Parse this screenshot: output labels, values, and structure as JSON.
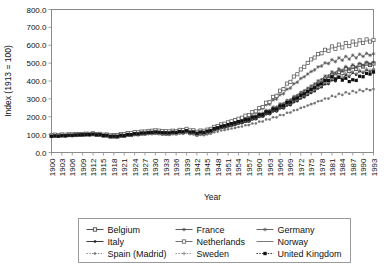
{
  "chart_data": {
    "type": "line",
    "title": "",
    "xlabel": "Year",
    "ylabel": "Index (1913 = 100)",
    "xlim": [
      1900,
      1993
    ],
    "ylim": [
      0,
      800
    ],
    "ytick_step": 100,
    "xtick_step": 3,
    "grid": false,
    "legend_position": "below",
    "ytick_labels": [
      "0.0",
      "100.0",
      "200.0",
      "300.0",
      "400.0",
      "500.0",
      "600.0",
      "700.0",
      "800.0"
    ],
    "xtick_labels": [
      "1900",
      "1903",
      "1906",
      "1909",
      "1912",
      "1915",
      "1918",
      "1921",
      "1924",
      "1927",
      "1930",
      "1933",
      "1936",
      "1939",
      "1942",
      "1945",
      "1948",
      "1951",
      "1954",
      "1957",
      "1960",
      "1963",
      "1966",
      "1969",
      "1972",
      "1975",
      "1978",
      "1981",
      "1984",
      "1987",
      "1990",
      "1993"
    ],
    "x": [
      1900,
      1903,
      1906,
      1909,
      1912,
      1915,
      1918,
      1921,
      1924,
      1927,
      1930,
      1933,
      1936,
      1939,
      1942,
      1945,
      1948,
      1951,
      1954,
      1957,
      1960,
      1963,
      1966,
      1969,
      1972,
      1975,
      1978,
      1981,
      1984,
      1987,
      1990,
      1993
    ],
    "series": [
      {
        "name": "Belgium",
        "marker": "square-open",
        "dash": "solid",
        "color": "#3a3a3a",
        "values": [
          92,
          95,
          98,
          100,
          103,
          96,
          88,
          95,
          102,
          108,
          112,
          106,
          110,
          118,
          104,
          112,
          138,
          152,
          168,
          182,
          205,
          228,
          252,
          282,
          318,
          352,
          392,
          428,
          452,
          470,
          488,
          498
        ]
      },
      {
        "name": "France",
        "marker": "star",
        "dash": "solid",
        "color": "#4a4a4a",
        "values": [
          95,
          97,
          99,
          101,
          104,
          98,
          92,
          100,
          106,
          112,
          118,
          112,
          115,
          122,
          110,
          118,
          142,
          158,
          175,
          192,
          215,
          240,
          268,
          298,
          335,
          372,
          412,
          445,
          468,
          482,
          495,
          505
        ]
      },
      {
        "name": "Germany",
        "marker": "star",
        "dash": "solid",
        "color": "#555555",
        "values": [
          96,
          99,
          101,
          103,
          105,
          100,
          94,
          102,
          110,
          116,
          122,
          116,
          120,
          128,
          115,
          122,
          145,
          162,
          182,
          205,
          238,
          275,
          318,
          365,
          412,
          452,
          488,
          512,
          525,
          535,
          545,
          552
        ]
      },
      {
        "name": "Italy",
        "marker": "dot",
        "dash": "solid",
        "color": "#222222",
        "values": [
          90,
          93,
          96,
          99,
          102,
          95,
          86,
          92,
          100,
          106,
          110,
          104,
          108,
          115,
          100,
          108,
          130,
          145,
          160,
          175,
          196,
          218,
          242,
          268,
          300,
          332,
          368,
          398,
          420,
          438,
          452,
          462
        ]
      },
      {
        "name": "Netherlands",
        "marker": "square-open",
        "dash": "solid",
        "color": "#606060",
        "values": [
          98,
          100,
          102,
          104,
          106,
          101,
          96,
          104,
          112,
          118,
          124,
          118,
          122,
          130,
          118,
          126,
          150,
          168,
          188,
          212,
          245,
          288,
          340,
          400,
          462,
          520,
          560,
          585,
          598,
          610,
          622,
          630
        ]
      },
      {
        "name": "Norway",
        "marker": "none",
        "dash": "solid",
        "color": "#6a6a6a",
        "values": [
          94,
          96,
          98,
          100,
          102,
          97,
          90,
          98,
          105,
          110,
          115,
          109,
          113,
          120,
          108,
          115,
          138,
          155,
          172,
          190,
          212,
          238,
          265,
          295,
          330,
          365,
          402,
          432,
          455,
          470,
          482,
          492
        ]
      },
      {
        "name": "Spain (Madrid)",
        "marker": "dot",
        "dash": "dotted",
        "color": "#777777",
        "values": [
          88,
          90,
          92,
          94,
          96,
          92,
          85,
          90,
          96,
          100,
          104,
          98,
          102,
          108,
          95,
          100,
          118,
          130,
          142,
          155,
          170,
          188,
          206,
          226,
          248,
          270,
          292,
          312,
          328,
          338,
          348,
          355
        ]
      },
      {
        "name": "Sweden",
        "marker": "plus",
        "dash": "dotted",
        "color": "#808080",
        "values": [
          93,
          95,
          97,
          99,
          101,
          96,
          89,
          96,
          103,
          108,
          113,
          107,
          111,
          118,
          106,
          113,
          135,
          150,
          166,
          182,
          202,
          225,
          250,
          278,
          310,
          342,
          378,
          408,
          430,
          445,
          458,
          468
        ]
      },
      {
        "name": "United Kingdom",
        "marker": "square-filled",
        "dash": "dotted",
        "color": "#111111",
        "values": [
          91,
          94,
          97,
          100,
          102,
          97,
          90,
          97,
          104,
          110,
          115,
          110,
          114,
          120,
          110,
          118,
          140,
          156,
          172,
          188,
          208,
          230,
          256,
          285,
          318,
          352,
          388,
          418,
          412,
          400,
          430,
          450
        ]
      }
    ]
  },
  "legend": {
    "entries": [
      {
        "label": "Belgium"
      },
      {
        "label": "France"
      },
      {
        "label": "Germany"
      },
      {
        "label": "Italy"
      },
      {
        "label": "Netherlands"
      },
      {
        "label": "Norway"
      },
      {
        "label": "Spain (Madrid)"
      },
      {
        "label": "Sweden"
      },
      {
        "label": "United Kingdom"
      }
    ]
  }
}
